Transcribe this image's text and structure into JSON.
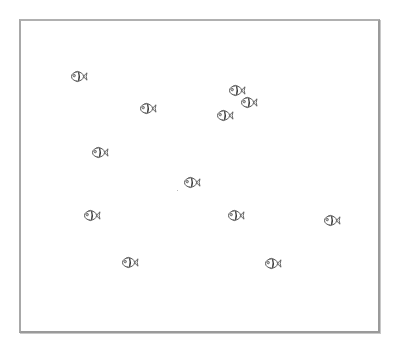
{
  "tank": {
    "border_color": "#9a9a9a",
    "background": "#ffffff"
  },
  "fish_icon": "fish-icon",
  "fish": [
    {
      "x": 79,
      "y": 76
    },
    {
      "x": 148,
      "y": 108
    },
    {
      "x": 237,
      "y": 90
    },
    {
      "x": 249,
      "y": 102
    },
    {
      "x": 225,
      "y": 115
    },
    {
      "x": 100,
      "y": 152
    },
    {
      "x": 192,
      "y": 182
    },
    {
      "x": 92,
      "y": 215
    },
    {
      "x": 236,
      "y": 215
    },
    {
      "x": 332,
      "y": 220
    },
    {
      "x": 130,
      "y": 262
    },
    {
      "x": 273,
      "y": 263
    }
  ],
  "specks": [
    {
      "x": 177,
      "y": 190
    }
  ]
}
